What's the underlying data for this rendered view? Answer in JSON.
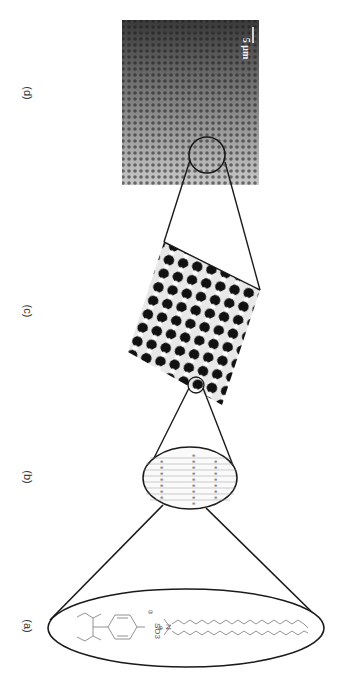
{
  "figure": {
    "panels": [
      {
        "id": "a",
        "label": "(a)",
        "description": "Amphiphilic ion-pair molecule: branched alkyl benzenesulfonate anion (SO3−) paired with dialkyl dimethylammonium cation (N+) with two long alkyl chains"
      },
      {
        "id": "b",
        "label": "(b)",
        "description": "Bilayer assembly of ion pairs"
      },
      {
        "id": "c",
        "label": "(c)",
        "description": "Hexagonal honeycomb pattern (simulated/AFM)"
      },
      {
        "id": "d",
        "label": "(d)",
        "description": "Microscopy image of hexagonally ordered porous film"
      }
    ],
    "chemistry": {
      "anion_group": "SO3",
      "anion_charge": "⊖",
      "cation_atom": "N",
      "cation_charge": "⊕"
    },
    "scale_bar": {
      "label": "5 μm",
      "color": "#ffffff"
    },
    "colors": {
      "line": "#1a1a1a",
      "molecule": "#666666",
      "background": "#ffffff"
    }
  }
}
